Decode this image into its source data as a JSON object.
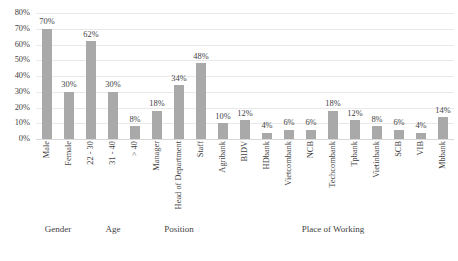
{
  "chart_data": {
    "type": "bar",
    "title": "",
    "subtitle": "",
    "xlabel": "",
    "ylabel": "",
    "ylim": [
      0,
      80
    ],
    "ytick_labels": [
      "80%",
      "70%",
      "60%",
      "50%",
      "40%",
      "30%",
      "20%",
      "10%",
      "0%"
    ],
    "ytick_values": [
      80,
      70,
      60,
      50,
      40,
      30,
      20,
      10,
      0
    ],
    "grid": true,
    "grid_axis": "y",
    "legend": false,
    "legend_position": "none",
    "value_label_format": "percent",
    "bar_color": "#a9a9a9",
    "background_color": "#ffffff",
    "categories": [
      "Male",
      "Female",
      "22 - 30",
      "31 - 40",
      "> 40",
      "Manager",
      "Head of Department",
      "Staff",
      "Agribank",
      "BIDV",
      "HDbank",
      "Vietcombank",
      "NCB",
      "Techcombank",
      "Tpbank",
      "Vietinbank",
      "SCB",
      "VIB",
      "Mbbank"
    ],
    "values": [
      70,
      30,
      62,
      30,
      8,
      18,
      34,
      48,
      10,
      12,
      4,
      6,
      6,
      18,
      12,
      8,
      6,
      4,
      14
    ],
    "value_labels": [
      "70%",
      "30%",
      "62%",
      "30%",
      "8%",
      "18%",
      "34%",
      "48%",
      "10%",
      "12%",
      "4%",
      "6%",
      "6%",
      "18%",
      "12%",
      "8%",
      "6%",
      "4%",
      "14%"
    ],
    "groups": [
      {
        "label": "Gender",
        "start_index": 0,
        "count": 2
      },
      {
        "label": "Age",
        "start_index": 2,
        "count": 3
      },
      {
        "label": "Position",
        "start_index": 5,
        "count": 3
      },
      {
        "label": "Place of Working",
        "start_index": 8,
        "count": 11
      }
    ]
  }
}
